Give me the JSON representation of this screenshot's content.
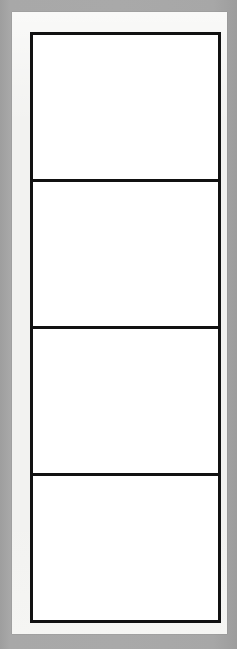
{
  "document": {
    "kind": "blank-four-panel-comic-template",
    "orientation": "portrait",
    "title": "",
    "background_color": "#a6a6a6",
    "page_color": "#f2f2f0",
    "panel_fill_color": "#ffffff",
    "panel_border_color": "#111111"
  },
  "page": {
    "caption": ""
  },
  "panels": [
    {
      "index": "1",
      "caption": "",
      "content": ""
    },
    {
      "index": "2",
      "caption": "",
      "content": ""
    },
    {
      "index": "3",
      "caption": "",
      "content": ""
    },
    {
      "index": "4",
      "caption": "",
      "content": ""
    }
  ]
}
